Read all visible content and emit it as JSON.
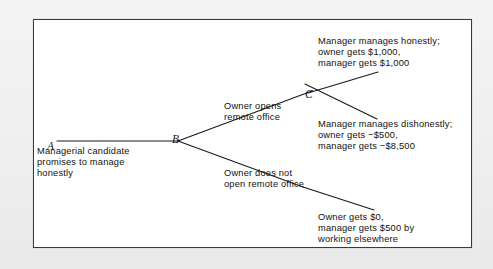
{
  "figure": {
    "type": "decision-tree",
    "border_color": "#3a3a3a",
    "background_color": "#ffffff",
    "page_background_color": "#f2f2f2",
    "line_color": "#1a1a1a"
  },
  "nodes": [
    {
      "id": "A",
      "label": "A",
      "x": 47,
      "y": 141
    },
    {
      "id": "B",
      "label": "B",
      "x": 172,
      "y": 134
    },
    {
      "id": "C",
      "label": "C",
      "x": 305,
      "y": 89
    }
  ],
  "edges": [
    {
      "name": "edge-a-to-b",
      "x1": 57,
      "y1": 141,
      "x2": 178,
      "y2": 141
    },
    {
      "name": "edge-b-to-c-open-office",
      "x1": 178,
      "y1": 141,
      "x2": 312,
      "y2": 91
    },
    {
      "name": "edge-b-to-no-office",
      "x1": 178,
      "y1": 141,
      "x2": 303,
      "y2": 187
    },
    {
      "name": "edge-c-to-honest",
      "x1": 308,
      "y1": 93,
      "x2": 378,
      "y2": 72
    },
    {
      "name": "edge-c-to-dishonest",
      "x1": 305,
      "y1": 84,
      "x2": 377,
      "y2": 119
    },
    {
      "name": "edge-no-office-to-outcome",
      "x1": 303,
      "y1": 187,
      "x2": 374,
      "y2": 210
    }
  ],
  "labels": {
    "root_description": "Managerial candidate\npromises to manage\nhonestly",
    "branch_open_office": "Owner opens\nremote office",
    "branch_no_office": "Owner does not\nopen remote office",
    "payoff_honest": "Manager manages honestly;\nowner gets $1,000,\nmanager gets $1,000",
    "payoff_dishonest": "Manager manages dishonestly;\nowner gets −$500,\nmanager gets −$8,500",
    "payoff_no_office": "Owner gets $0,\nmanager gets $500 by\nworking elsewhere"
  },
  "text_positions": {
    "root_description": {
      "x": 37,
      "y": 146
    },
    "branch_open_office": {
      "x": 224,
      "y": 101
    },
    "branch_no_office": {
      "x": 224,
      "y": 168
    },
    "payoff_honest": {
      "x": 318,
      "y": 36
    },
    "payoff_dishonest": {
      "x": 318,
      "y": 119
    },
    "payoff_no_office": {
      "x": 318,
      "y": 212
    }
  }
}
